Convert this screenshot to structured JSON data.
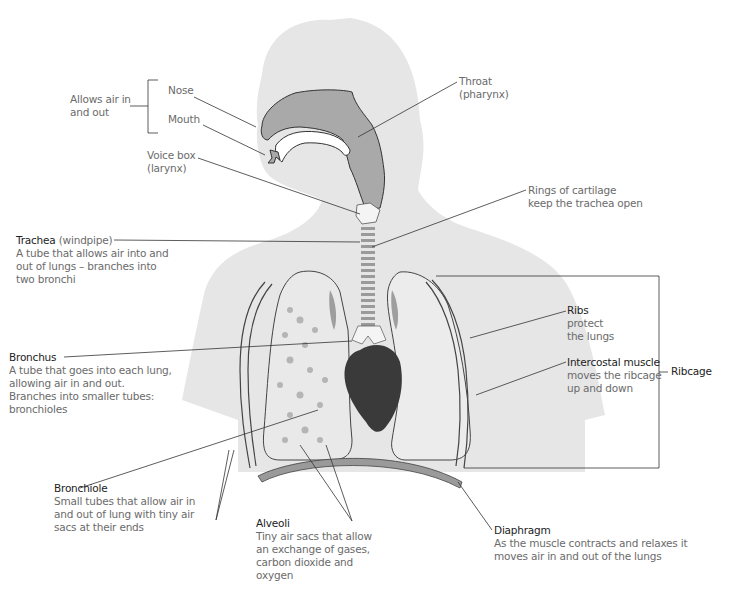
{
  "diagram": {
    "colors": {
      "silhouette": "#e6e6e6",
      "airway": "#a9a9a9",
      "lung": "#e9e9e9",
      "heart": "#3a3a3a",
      "leader_line": "#333333",
      "title_text": "#222222",
      "desc_text": "#6b6b6b"
    }
  },
  "labels": {
    "allows_air": {
      "text": "Allows air in\nand out",
      "line1": "Allows air in",
      "line2": "and out"
    },
    "nose": {
      "title": "Nose"
    },
    "mouth": {
      "title": "Mouth"
    },
    "voice_box": {
      "line1": "Voice box",
      "line2": "(larynx)"
    },
    "throat": {
      "line1": "Throat",
      "line2": "(pharynx)"
    },
    "rings": {
      "line1": "Rings of cartilage",
      "line2": "keep the trachea open"
    },
    "trachea": {
      "title": "Trachea",
      "subtitle": " (windpipe)",
      "desc": [
        "A tube that allows air into and",
        "out of lungs – branches into",
        "two bronchi"
      ]
    },
    "bronchus": {
      "title": "Bronchus",
      "desc": [
        "A tube that goes into each lung,",
        "allowing air in and out.",
        "Branches into smaller tubes:",
        "bronchioles"
      ]
    },
    "bronchiole": {
      "title": "Bronchiole",
      "desc": [
        "Small tubes that allow air in",
        "and out of lung with tiny air",
        "sacs at their ends"
      ]
    },
    "alveoli": {
      "title": "Alveoli",
      "desc": [
        "Tiny air sacs that allow",
        "an exchange of gases,",
        "carbon dioxide and",
        "oxygen"
      ]
    },
    "diaphragm": {
      "title": "Diaphragm",
      "desc": [
        "As the muscle contracts and relaxes it",
        "moves air in and out of the lungs"
      ]
    },
    "ribs": {
      "title": "Ribs",
      "desc": [
        "protect",
        "the lungs"
      ]
    },
    "intercostal": {
      "title": "Intercostal muscle",
      "desc": [
        "moves the ribcage",
        "up and down"
      ]
    },
    "ribcage": {
      "title": "Ribcage"
    }
  }
}
